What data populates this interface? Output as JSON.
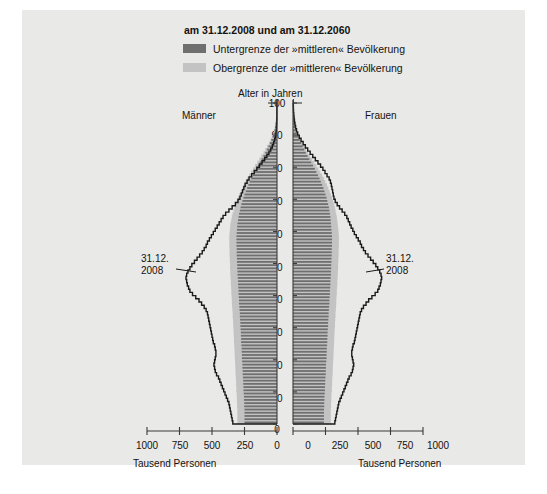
{
  "title": "am 31.12.2008 und am 31.12.2060",
  "legend": {
    "items": [
      {
        "label": "Untergrenze der »mittleren« Bevölkerung",
        "color": "#6f6f6f"
      },
      {
        "label": "Obergrenze der »mittleren« Bevölkerung",
        "color": "#c3c3c3"
      }
    ]
  },
  "axis": {
    "y_title": "Alter in Jahren",
    "left_group": "Männer",
    "right_group": "Frauen",
    "x_unit_left": "Tausend Personen",
    "x_unit_right": "Tausend Personen",
    "y_ticks": [
      "100",
      "90",
      "80",
      "70",
      "60",
      "50",
      "40",
      "30",
      "20",
      "10",
      "0"
    ],
    "x_ticks_left": [
      "1000",
      "750",
      "500",
      "250",
      "0"
    ],
    "x_ticks_right": [
      "0",
      "250",
      "500",
      "750",
      "1000"
    ]
  },
  "annotations": {
    "left": {
      "line1": "31.12.",
      "line2": "2008"
    },
    "right": {
      "line1": "31.12.",
      "line2": "2008"
    }
  },
  "colors": {
    "panel_bg": "#e9e9e7",
    "bar_dark": "#6f6f6f",
    "bar_light": "#c3c3c3",
    "outline": "#1a1a1a",
    "axis": "#3a3a3a",
    "text": "#15120f"
  },
  "chart_data": {
    "type": "bar",
    "title": "am 31.12.2008 und am 31.12.2060",
    "xlabel": "Tausend Personen",
    "ylabel": "Alter in Jahren",
    "orientation": "population-pyramid",
    "xlim": [
      0,
      1000
    ],
    "ylim": [
      0,
      100
    ],
    "grid": false,
    "legend_position": "top",
    "series": [
      {
        "name": "Untergrenze der »mittleren« Bevölkerung",
        "color": "#6f6f6f"
      },
      {
        "name": "Obergrenze der »mittleren« Bevölkerung",
        "color": "#c3c3c3"
      },
      {
        "name": "31.12.2008",
        "color": "#1a1a1a",
        "style": "outline"
      }
    ],
    "ages": [
      0,
      1,
      2,
      3,
      4,
      5,
      6,
      7,
      8,
      9,
      10,
      11,
      12,
      13,
      14,
      15,
      16,
      17,
      18,
      19,
      20,
      21,
      22,
      23,
      24,
      25,
      26,
      27,
      28,
      29,
      30,
      31,
      32,
      33,
      34,
      35,
      36,
      37,
      38,
      39,
      40,
      41,
      42,
      43,
      44,
      45,
      46,
      47,
      48,
      49,
      50,
      51,
      52,
      53,
      54,
      55,
      56,
      57,
      58,
      59,
      60,
      61,
      62,
      63,
      64,
      65,
      66,
      67,
      68,
      69,
      70,
      71,
      72,
      73,
      74,
      75,
      76,
      77,
      78,
      79,
      80,
      81,
      82,
      83,
      84,
      85,
      86,
      87,
      88,
      89,
      90,
      91,
      92,
      93,
      94,
      95,
      96,
      97,
      98,
      99,
      100
    ],
    "maenner_2060_untergrenze": [
      250,
      250,
      250,
      250,
      250,
      252,
      252,
      254,
      254,
      256,
      258,
      258,
      260,
      260,
      262,
      264,
      264,
      266,
      266,
      268,
      270,
      270,
      272,
      272,
      274,
      276,
      276,
      278,
      278,
      280,
      282,
      282,
      284,
      286,
      286,
      288,
      290,
      292,
      292,
      294,
      296,
      296,
      298,
      300,
      300,
      302,
      304,
      304,
      306,
      306,
      308,
      308,
      310,
      310,
      310,
      312,
      312,
      312,
      312,
      310,
      308,
      306,
      304,
      300,
      296,
      292,
      286,
      280,
      274,
      266,
      258,
      250,
      240,
      230,
      220,
      210,
      198,
      186,
      174,
      160,
      146,
      132,
      118,
      104,
      90,
      78,
      66,
      54,
      44,
      34,
      26,
      20,
      15,
      11,
      8,
      5,
      4,
      3,
      2,
      1,
      1
    ],
    "maenner_2060_obergrenze": [
      305,
      305,
      305,
      305,
      305,
      307,
      307,
      309,
      309,
      311,
      313,
      313,
      315,
      315,
      317,
      319,
      319,
      321,
      321,
      323,
      325,
      325,
      327,
      327,
      329,
      331,
      331,
      333,
      333,
      335,
      337,
      337,
      339,
      341,
      341,
      343,
      345,
      347,
      347,
      349,
      351,
      351,
      353,
      355,
      355,
      357,
      359,
      359,
      361,
      361,
      363,
      363,
      365,
      365,
      365,
      367,
      367,
      367,
      367,
      365,
      363,
      360,
      357,
      352,
      347,
      342,
      334,
      327,
      319,
      310,
      300,
      290,
      278,
      266,
      254,
      242,
      228,
      214,
      200,
      184,
      168,
      152,
      136,
      120,
      104,
      90,
      76,
      62,
      50,
      40,
      30,
      23,
      17,
      13,
      9,
      6,
      5,
      3,
      2,
      1,
      1
    ],
    "maenner_2008": [
      340,
      345,
      350,
      355,
      360,
      365,
      370,
      380,
      390,
      400,
      410,
      420,
      430,
      440,
      450,
      465,
      475,
      480,
      485,
      480,
      475,
      470,
      470,
      475,
      480,
      490,
      495,
      500,
      505,
      510,
      515,
      520,
      525,
      530,
      535,
      545,
      560,
      580,
      600,
      625,
      650,
      670,
      680,
      690,
      695,
      700,
      695,
      685,
      670,
      655,
      635,
      615,
      595,
      575,
      560,
      545,
      535,
      520,
      505,
      490,
      475,
      460,
      445,
      430,
      415,
      395,
      370,
      345,
      320,
      300,
      285,
      275,
      265,
      255,
      245,
      230,
      215,
      195,
      175,
      155,
      135,
      115,
      95,
      78,
      62,
      48,
      36,
      26,
      18,
      12,
      8,
      5,
      4,
      3,
      2,
      1,
      1,
      1,
      1,
      1,
      0
    ],
    "frauen_2060_untergrenze": [
      238,
      238,
      238,
      238,
      238,
      240,
      240,
      242,
      242,
      244,
      246,
      246,
      248,
      248,
      250,
      252,
      252,
      254,
      254,
      256,
      258,
      258,
      260,
      260,
      262,
      264,
      264,
      266,
      266,
      268,
      270,
      270,
      272,
      274,
      274,
      276,
      278,
      280,
      280,
      282,
      284,
      284,
      286,
      288,
      288,
      290,
      292,
      292,
      294,
      294,
      296,
      296,
      298,
      298,
      298,
      300,
      300,
      300,
      300,
      298,
      296,
      294,
      292,
      290,
      288,
      284,
      280,
      276,
      270,
      264,
      258,
      250,
      242,
      234,
      224,
      214,
      204,
      192,
      180,
      168,
      154,
      140,
      126,
      112,
      98,
      86,
      74,
      62,
      52,
      42,
      34,
      27,
      21,
      16,
      12,
      9,
      7,
      5,
      3,
      2,
      1
    ],
    "frauen_2060_obergrenze": [
      291,
      291,
      291,
      291,
      291,
      293,
      293,
      295,
      295,
      297,
      299,
      299,
      301,
      301,
      303,
      305,
      305,
      307,
      307,
      309,
      311,
      311,
      313,
      313,
      315,
      317,
      317,
      319,
      319,
      321,
      323,
      323,
      325,
      327,
      327,
      329,
      331,
      333,
      333,
      335,
      337,
      337,
      339,
      341,
      341,
      343,
      345,
      345,
      347,
      347,
      349,
      349,
      351,
      351,
      351,
      353,
      353,
      353,
      353,
      351,
      349,
      346,
      343,
      340,
      337,
      332,
      327,
      322,
      315,
      308,
      300,
      291,
      282,
      272,
      261,
      249,
      237,
      224,
      210,
      196,
      180,
      164,
      147,
      131,
      114,
      100,
      86,
      72,
      60,
      49,
      39,
      31,
      24,
      19,
      14,
      11,
      8,
      6,
      4,
      2,
      1
    ],
    "frauen_2008": [
      322,
      327,
      332,
      337,
      342,
      347,
      352,
      362,
      372,
      382,
      392,
      402,
      412,
      422,
      432,
      447,
      457,
      462,
      467,
      462,
      457,
      452,
      452,
      457,
      462,
      472,
      477,
      482,
      487,
      492,
      497,
      502,
      507,
      512,
      517,
      527,
      542,
      562,
      582,
      607,
      632,
      652,
      662,
      672,
      677,
      682,
      677,
      667,
      652,
      637,
      617,
      597,
      577,
      557,
      542,
      527,
      517,
      502,
      487,
      472,
      460,
      447,
      436,
      425,
      414,
      398,
      378,
      358,
      340,
      325,
      315,
      310,
      305,
      300,
      295,
      288,
      278,
      262,
      246,
      230,
      212,
      192,
      172,
      152,
      132,
      113,
      95,
      78,
      62,
      48,
      36,
      27,
      20,
      15,
      11,
      8,
      6,
      4,
      3,
      2,
      1
    ]
  }
}
